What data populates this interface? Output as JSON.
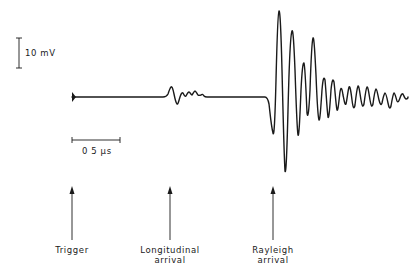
{
  "figure": {
    "type": "ultrasonic waveform trace",
    "scale_bars": {
      "voltage": {
        "label": "10 mV",
        "value": 10,
        "unit": "mV"
      },
      "time": {
        "label": "0 5 µs",
        "value": 0.5,
        "unit": "µs"
      }
    },
    "markers": [
      {
        "id": "trigger",
        "lines": [
          "Trigger"
        ]
      },
      {
        "id": "longitudinal",
        "lines": [
          "Longitudinal",
          "arrival"
        ]
      },
      {
        "id": "rayleigh",
        "lines": [
          "Rayleigh",
          "arrival"
        ]
      }
    ],
    "trace": {
      "description": "Flat baseline from trigger, small oscillation at longitudinal arrival, large decaying oscillations at Rayleigh arrival",
      "color": "#1a1a1a"
    }
  }
}
